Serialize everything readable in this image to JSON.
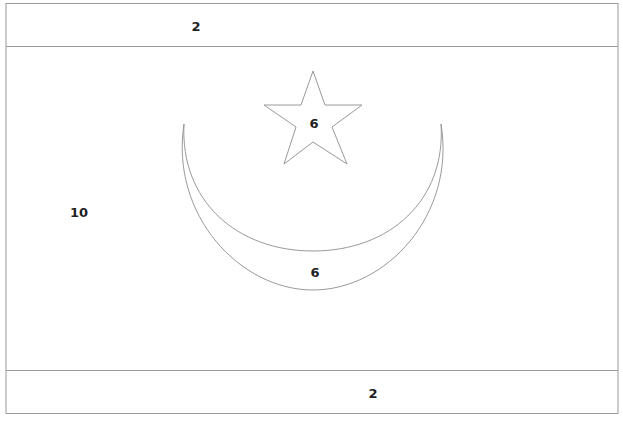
{
  "flag": {
    "name": "Mauritania",
    "regions": [
      {
        "id": "top-stripe",
        "label": "2"
      },
      {
        "id": "field",
        "label": "10"
      },
      {
        "id": "star",
        "label": "6"
      },
      {
        "id": "crescent",
        "label": "6"
      },
      {
        "id": "bottom-stripe",
        "label": "2"
      }
    ]
  },
  "colors": {
    "outline": "#9a9a9a",
    "label": "#222222",
    "background": "#ffffff"
  }
}
